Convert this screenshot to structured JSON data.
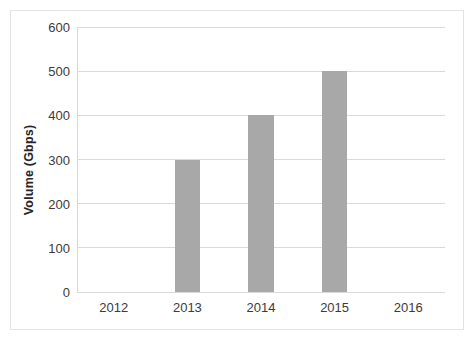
{
  "chart_data": {
    "type": "bar",
    "title": "",
    "xlabel": "",
    "ylabel": "Volume (Gbps)",
    "categories": [
      "2012",
      "2013",
      "2014",
      "2015",
      "2016"
    ],
    "values": [
      null,
      300,
      400,
      500,
      null
    ],
    "series": [
      {
        "name": "Volume",
        "values": [
          null,
          300,
          400,
          500,
          null
        ]
      }
    ],
    "ylim": [
      0,
      600
    ],
    "y_ticks": [
      0,
      100,
      200,
      300,
      400,
      500,
      600
    ],
    "y_tick_labels": [
      "0",
      "100",
      "200",
      "300",
      "400",
      "500",
      "600"
    ],
    "grid": true,
    "legend": false,
    "bar_color": "#a8a8a8",
    "gridline_color": "#d9d9d9",
    "border_color": "#e3e3e3",
    "background_color": "#ffffff"
  }
}
